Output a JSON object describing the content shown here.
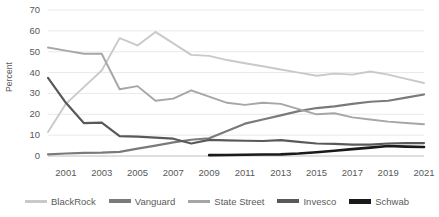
{
  "chart_data": {
    "type": "line",
    "title": "",
    "xlabel": "",
    "ylabel": "Percent",
    "ylim": [
      0,
      70
    ],
    "xlim": [
      2000,
      2021
    ],
    "grid": true,
    "legend_position": "bottom",
    "x": [
      2000,
      2001,
      2002,
      2003,
      2004,
      2005,
      2006,
      2007,
      2008,
      2009,
      2010,
      2011,
      2012,
      2013,
      2014,
      2015,
      2016,
      2017,
      2018,
      2019,
      2020,
      2021
    ],
    "xticks": [
      "2001",
      "2003",
      "2005",
      "2007",
      "2009",
      "2011",
      "2013",
      "2015",
      "2017",
      "2019",
      "2021"
    ],
    "yticks": [
      "0",
      "10",
      "20",
      "30",
      "40",
      "50",
      "60",
      "70"
    ],
    "series": [
      {
        "name": "BlackRock",
        "color": "#c9c9c9",
        "values": [
          11.5,
          25.0,
          33.0,
          41.0,
          56.5,
          53.0,
          59.5,
          54.0,
          48.5,
          48.0,
          46.0,
          44.5,
          43.0,
          41.5,
          40.0,
          38.5,
          39.5,
          39.0,
          40.5,
          39.0,
          37.0,
          35.0
        ]
      },
      {
        "name": "Vanguard",
        "color": "#7a7a7a",
        "values": [
          0.8,
          1.2,
          1.5,
          1.6,
          2.0,
          3.5,
          5.0,
          6.5,
          7.8,
          8.5,
          12.0,
          15.5,
          17.5,
          19.5,
          21.5,
          23.0,
          23.8,
          25.0,
          26.0,
          26.5,
          28.0,
          29.5
        ]
      },
      {
        "name": "State Street",
        "color": "#a6a6a6",
        "values": [
          52.0,
          50.5,
          49.0,
          49.0,
          32.0,
          33.5,
          26.5,
          27.5,
          31.5,
          28.5,
          25.5,
          24.5,
          25.5,
          25.0,
          22.5,
          20.0,
          20.5,
          18.5,
          17.5,
          16.5,
          15.8,
          15.2
        ]
      },
      {
        "name": "Invesco",
        "color": "#595959",
        "values": [
          37.5,
          25.5,
          15.8,
          16.0,
          9.5,
          9.3,
          8.8,
          8.3,
          6.0,
          7.7,
          7.5,
          7.3,
          7.2,
          7.6,
          6.8,
          6.0,
          5.8,
          5.5,
          5.5,
          6.0,
          6.2,
          6.2
        ]
      },
      {
        "name": "Schwab",
        "color": "#1a1a1a",
        "values": [
          null,
          null,
          null,
          null,
          null,
          null,
          null,
          null,
          null,
          0.4,
          0.5,
          0.6,
          0.7,
          0.8,
          1.2,
          1.8,
          2.5,
          3.3,
          4.0,
          4.8,
          4.5,
          4.3
        ]
      }
    ]
  },
  "legend": {
    "items": [
      {
        "label": "BlackRock",
        "color": "#c9c9c9",
        "thickness": 3
      },
      {
        "label": "Vanguard",
        "color": "#7a7a7a",
        "thickness": 4
      },
      {
        "label": "State Street",
        "color": "#a6a6a6",
        "thickness": 3
      },
      {
        "label": "Invesco",
        "color": "#595959",
        "thickness": 4
      },
      {
        "label": "Schwab",
        "color": "#1a1a1a",
        "thickness": 5
      }
    ]
  }
}
